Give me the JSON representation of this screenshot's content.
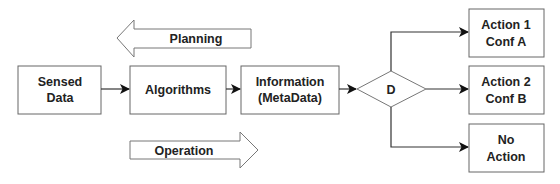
{
  "diagram": {
    "nodes": {
      "sensed_data": {
        "line1": "Sensed",
        "line2": "Data"
      },
      "algorithms": {
        "label": "Algorithms"
      },
      "information": {
        "line1": "Information",
        "line2": "(MetaData)"
      },
      "decision": {
        "label": "D"
      },
      "action1": {
        "line1": "Action 1",
        "line2": "Conf A"
      },
      "action2": {
        "line1": "Action 2",
        "line2": "Conf B"
      },
      "no_action": {
        "line1": "No",
        "line2": "Action"
      }
    },
    "flow_arrows": {
      "planning": {
        "label": "Planning",
        "direction": "left"
      },
      "operation": {
        "label": "Operation",
        "direction": "right"
      }
    },
    "edges": [
      {
        "from": "Sensed Data",
        "to": "Algorithms"
      },
      {
        "from": "Algorithms",
        "to": "Information (MetaData)"
      },
      {
        "from": "Information (MetaData)",
        "to": "D"
      },
      {
        "from": "D",
        "to": "Action 1 Conf A"
      },
      {
        "from": "D",
        "to": "Action 2 Conf B"
      },
      {
        "from": "D",
        "to": "No Action"
      }
    ],
    "colors": {
      "stroke": "#555555",
      "text": "#222222",
      "arrowhead": "#111111",
      "background": "#ffffff"
    }
  }
}
